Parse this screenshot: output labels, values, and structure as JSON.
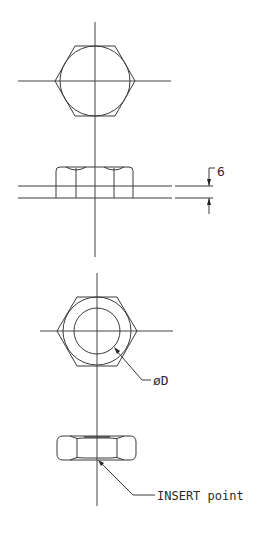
{
  "drawing": {
    "views": [
      {
        "name": "top-plan-view-hex-bolt-head",
        "shape": "hexagon with inscribed circle"
      },
      {
        "name": "top-side-view-hex-bolt-head",
        "shape": "hex head side elevation on plate"
      },
      {
        "name": "bottom-plan-view-hex-nut",
        "shape": "hexagon with inner bore circle"
      },
      {
        "name": "bottom-side-view-hex-nut",
        "shape": "hex nut side elevation"
      }
    ],
    "annotations": {
      "thickness_dimension": "6",
      "diameter_label": "øD",
      "insert_label": "INSERT point"
    },
    "colors": {
      "line": "#3a3a3a",
      "background": "#ffffff"
    }
  }
}
